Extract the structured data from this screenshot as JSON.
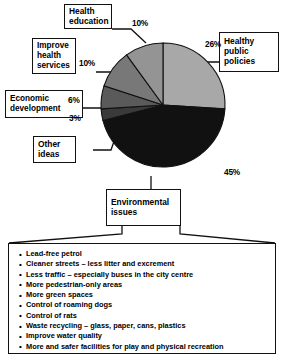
{
  "chart_data": {
    "type": "pie",
    "title": "",
    "legend_position": "callout-boxes",
    "categories": [
      "Healthy public policies",
      "Environmental issues",
      "Other ideas",
      "Economic development",
      "Improve health services",
      "Health education"
    ],
    "values": [
      26,
      45,
      3,
      6,
      10,
      10
    ],
    "labels": [
      "26%",
      "45%",
      "3%",
      "6%",
      "10%",
      "10%"
    ],
    "colors": [
      "#a8a8a8",
      "#111111",
      "#3a3a3a",
      "#5a5a5a",
      "#787878",
      "#949494"
    ],
    "start_angle_deg": 0,
    "direction": "clockwise",
    "units": "percent"
  },
  "callouts": {
    "health_education": "Health\neducation",
    "improve_health_services": "Improve\nhealth\nservices",
    "economic_development": "Economic\ndevelopment",
    "other_ideas": "Other\nideas",
    "healthy_public_policies": "Healthy\npublic\npolicies",
    "environmental_issues": "Environmental\nissues"
  },
  "percent_labels": {
    "health_education": "10%",
    "improve_health_services": "10%",
    "economic_development": "6%",
    "other_ideas": "3%",
    "healthy_public_policies": "26%",
    "environmental_issues": "45%"
  },
  "environmental_list": {
    "bullet_glyph": "•",
    "items": [
      "Lead-free petrol",
      "Cleaner streets – less litter and excrement",
      "Less traffic – especially buses in the city centre",
      "More pedestrian-only areas",
      "More green spaces",
      "Control of roaming dogs",
      "Control of rats",
      "Waste recycling – glass, paper, cans, plastics",
      "Improve water quality",
      "More and safer facilities for play and physical recreation"
    ]
  }
}
